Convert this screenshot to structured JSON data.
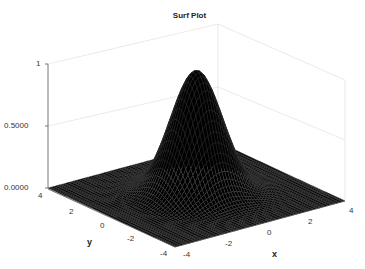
{
  "chart_data": {
    "type": "surface",
    "title": "Surf Plot",
    "xlabel": "x",
    "ylabel": "y",
    "zlabel": "",
    "function": "Gaussian bump z = exp(-(x^2+y^2)/2)",
    "xlim": [
      -4,
      4
    ],
    "ylim": [
      -4,
      4
    ],
    "zlim": [
      0,
      1
    ],
    "x_ticks": [
      "-4",
      "-2",
      "0",
      "2",
      "4"
    ],
    "y_ticks": [
      "-4",
      "-2",
      "0",
      "2",
      "4"
    ],
    "z_ticks": [
      "0.0000",
      "0.5000",
      "1"
    ],
    "peak": {
      "x": 0,
      "y": 0,
      "z": 1
    },
    "colormap": "black surface with gray mesh edges",
    "grid": true,
    "legend": null
  },
  "labels": {
    "title": "Surf Plot",
    "x_axis": "x",
    "y_axis": "y",
    "z_ticks": [
      "1",
      "0.5000",
      "0.0000"
    ],
    "x_ticks": [
      "-4",
      "-2",
      "0",
      "2",
      "4"
    ],
    "y_ticks": [
      "4",
      "2",
      "0",
      "-2",
      "-4"
    ]
  }
}
